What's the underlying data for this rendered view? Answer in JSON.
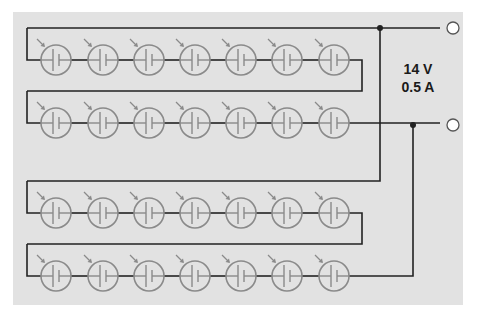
{
  "diagram": {
    "type": "solar-panel-wiring",
    "rating": {
      "voltage": "14 V",
      "current": "0.5 A"
    },
    "strings": 4,
    "cells_per_string": 7,
    "colors": {
      "background": "#e2e2e2",
      "wire": "#222222",
      "cell": "#8a8a8a"
    },
    "terminals": [
      "positive-terminal",
      "negative-terminal"
    ]
  }
}
